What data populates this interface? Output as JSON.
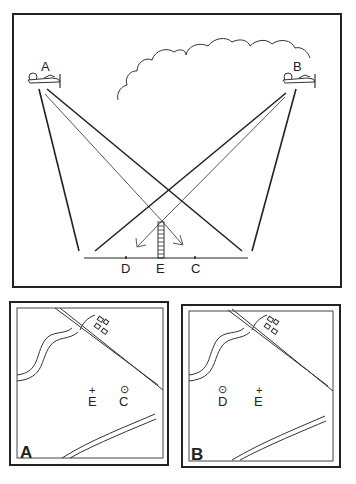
{
  "main_diagram": {
    "aircraft": [
      {
        "label": "A",
        "side": "left"
      },
      {
        "label": "B",
        "side": "right"
      }
    ],
    "ground_points": [
      "D",
      "E",
      "C"
    ],
    "elements": [
      "cloud",
      "tower-at-E",
      "sight-lines",
      "ground-line"
    ]
  },
  "maps": [
    {
      "panel_label": "A",
      "points": [
        {
          "label": "E",
          "symbol": "+"
        },
        {
          "label": "C",
          "symbol": "⊙"
        }
      ]
    },
    {
      "panel_label": "B",
      "points": [
        {
          "label": "D",
          "symbol": "⊙"
        },
        {
          "label": "E",
          "symbol": "+"
        }
      ]
    }
  ]
}
